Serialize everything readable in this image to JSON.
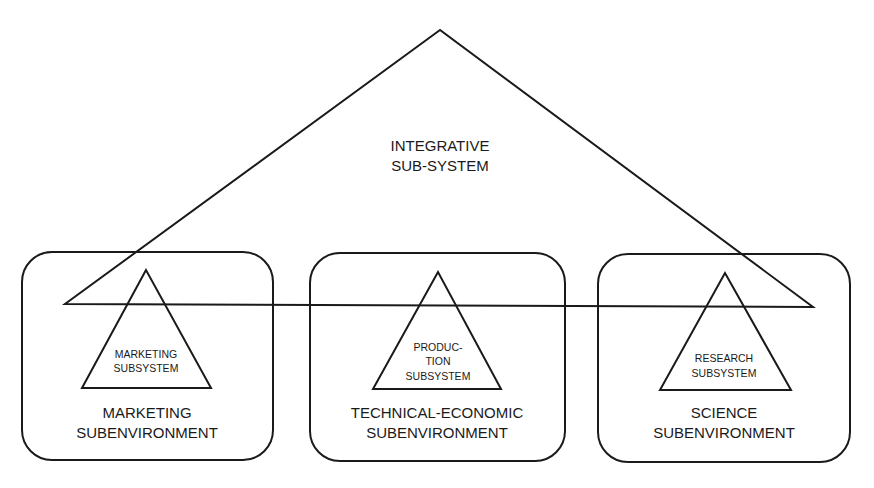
{
  "integrative": {
    "label_lines": [
      "INTEGRATIVE",
      "SUB-SYSTEM"
    ]
  },
  "subenvironments": [
    {
      "id": "marketing",
      "label_lines": [
        "MARKETING",
        "SUBENVIRONMENT"
      ],
      "subsystem_lines": [
        "MARKETING",
        "SUBSYSTEM"
      ]
    },
    {
      "id": "technical-economic",
      "label_lines": [
        "TECHNICAL-ECONOMIC",
        "SUBENVIRONMENT"
      ],
      "subsystem_lines": [
        "PRODUC-",
        "TION",
        "SUBSYSTEM"
      ]
    },
    {
      "id": "science",
      "label_lines": [
        "SCIENCE",
        "SUBENVIRONMENT"
      ],
      "subsystem_lines": [
        "RESEARCH",
        "SUBSYSTEM"
      ]
    }
  ]
}
